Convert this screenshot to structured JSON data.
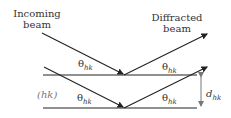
{
  "diagram": {
    "labels": {
      "incoming_line1": "Incoming",
      "incoming_line2": "beam",
      "diffracted_line1": "Diffracted",
      "diffracted_line2": "beam",
      "plane_label": "(hk)",
      "spacing_label_main": "d",
      "spacing_label_sub": "hk",
      "theta_symbol": "θ",
      "theta_sub": "hk"
    },
    "colors": {
      "line": "#222222",
      "text": "#333333",
      "plane_label": "#777777",
      "spacing_arrow": "#777777"
    }
  }
}
